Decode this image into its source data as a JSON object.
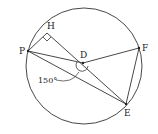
{
  "diagram": {
    "type": "geometry-circle",
    "points": {
      "P": {
        "label": "P",
        "x": 28,
        "y": 51
      },
      "H": {
        "label": "H",
        "x": 47,
        "y": 33
      },
      "D": {
        "label": "D",
        "x": 83,
        "y": 63
      },
      "F": {
        "label": "F",
        "x": 139,
        "y": 48
      },
      "E": {
        "label": "E",
        "x": 126,
        "y": 104
      }
    },
    "circle": {
      "cx": 84,
      "cy": 66,
      "r": 58
    },
    "segments": [
      "PH",
      "HE",
      "PD",
      "DF",
      "PE",
      "FE"
    ],
    "right_angle_at": "H",
    "angle_label": "150°",
    "angle_at": "D"
  },
  "labels": {
    "P": "P",
    "H": "H",
    "D": "D",
    "F": "F",
    "E": "E",
    "angle": "150°"
  }
}
